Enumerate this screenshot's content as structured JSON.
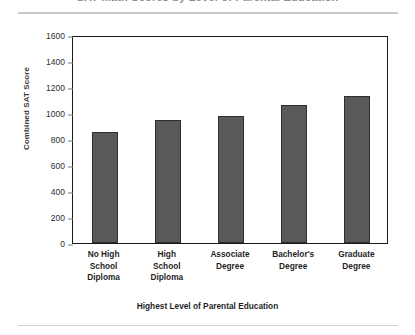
{
  "figure": {
    "title": "SAT Math Scores by Level of Parental Education",
    "y_axis_title": "Combined SAT Score",
    "x_axis_title": "Highest Level of Parental Education"
  },
  "chart_data": {
    "type": "bar",
    "title": "SAT Math Scores by Level of Parental Education",
    "xlabel": "Highest Level of Parental Education",
    "ylabel": "Combined SAT Score",
    "categories": [
      "No High School Diploma",
      "High School Diploma",
      "Associate Degree",
      "Bachelor's Degree",
      "Graduate Degree"
    ],
    "category_lines": [
      [
        "No High",
        "School",
        "Diploma"
      ],
      [
        "High",
        "School",
        "Diploma"
      ],
      [
        "Associate",
        "Degree"
      ],
      [
        "Bachelor's",
        "Degree"
      ],
      [
        "Graduate",
        "Degree"
      ]
    ],
    "values": [
      855,
      945,
      980,
      1060,
      1130
    ],
    "ylim": [
      0,
      1600
    ],
    "ytick_step": 200,
    "yticks": [
      1600,
      1400,
      1200,
      1000,
      800,
      600,
      400,
      200,
      0
    ],
    "ytick_labels": [
      "1600",
      "1400",
      "1200",
      "1000",
      "800",
      "600",
      "400",
      "200",
      "0"
    ],
    "grid": false,
    "legend": false,
    "bar_color": "#595959",
    "bar_edge_color": "#2e2e2e",
    "axis_color": "#1a1a1a"
  }
}
